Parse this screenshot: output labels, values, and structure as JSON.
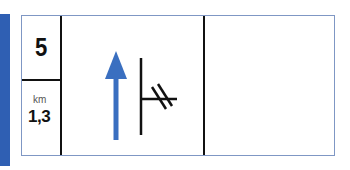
{
  "sign": {
    "exit_number": "5",
    "distance_unit": "km",
    "distance_value": "1,3",
    "colors": {
      "accent_bar": "#2f5fb3",
      "arrow": "#3a6fc0",
      "lines": "#111111",
      "border": "#7f97c4"
    },
    "symbols": {
      "arrow": "straight-ahead-arrow",
      "junction": "side-road-junction-with-rail-crossing-marks"
    }
  }
}
